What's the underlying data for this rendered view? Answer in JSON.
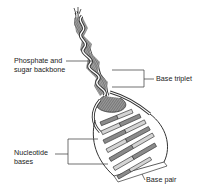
{
  "figure": {
    "labels": {
      "backbone_line1": "Phosphate and",
      "backbone_line2": "sugar backbone",
      "base_triplet": "Base triplet",
      "nucleotide_line1": "Nucleotide",
      "nucleotide_line2": "bases",
      "base_pair": "Base pair"
    },
    "colors": {
      "outline": "#333333",
      "strand_dark": "#555555",
      "base_dark": "#8a8a8a",
      "base_light": "#d4d4d4",
      "background": "#ffffff"
    }
  }
}
